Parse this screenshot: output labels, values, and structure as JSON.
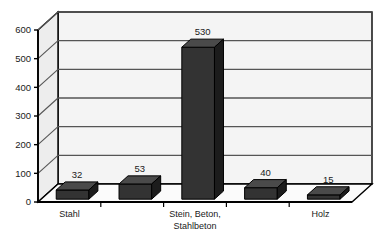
{
  "chart_data": {
    "type": "bar",
    "title": "",
    "subtitle": "",
    "xlabel": "",
    "ylabel": "",
    "style": "3d-column",
    "grid": true,
    "legend": false,
    "ylim": [
      0,
      600
    ],
    "yticks": [
      0,
      100,
      200,
      300,
      400,
      500,
      600
    ],
    "ytick_labels": [
      "0",
      "100",
      "200",
      "300",
      "400",
      "500",
      "600"
    ],
    "categories": [
      "Stahl",
      "",
      "Stein, Beton, Stahlbeton",
      "",
      "Holz"
    ],
    "visible_category_labels": [
      {
        "index": 0,
        "lines": [
          "Stahl"
        ]
      },
      {
        "index": 2,
        "lines": [
          "Stein, Beton,",
          "Stahlbeton"
        ]
      },
      {
        "index": 4,
        "lines": [
          "Holz"
        ]
      }
    ],
    "values": [
      32,
      53,
      530,
      40,
      15
    ],
    "value_labels": [
      "32",
      "53",
      "530",
      "40",
      "15"
    ],
    "series": [
      {
        "name": "",
        "values": [
          32,
          53,
          530,
          40,
          15
        ]
      }
    ]
  },
  "colors": {
    "bar_front": "#333333",
    "bar_top": "#4a4a4a",
    "bar_side": "#1c1c1c",
    "plot_background": "#f4f4f4",
    "wall_side": "#ededed",
    "floor": "#fbfbfb",
    "gridline": "#555555",
    "axis": "#000000",
    "text": "#1a1a1a"
  }
}
